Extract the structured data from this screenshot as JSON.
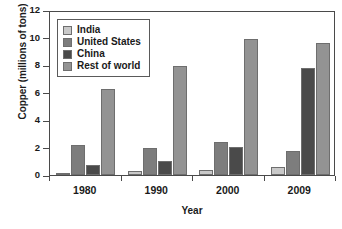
{
  "chart_data": {
    "type": "bar",
    "title": "",
    "xlabel": "Year",
    "ylabel": "Copper (millions of tons)",
    "categories": [
      "1980",
      "1990",
      "2000",
      "2009"
    ],
    "ylim": [
      0,
      12
    ],
    "yticks": [
      0,
      2,
      4,
      6,
      8,
      10,
      12
    ],
    "ytick_labels": [
      "0",
      "2",
      "4",
      "6",
      "8",
      "10",
      "12"
    ],
    "grid": false,
    "legend_position": "top-left",
    "series": [
      {
        "name": "India",
        "color": "#c9c9c9",
        "values": [
          0.17,
          0.27,
          0.37,
          0.55
        ]
      },
      {
        "name": "United States",
        "color": "#7d7d7d",
        "values": [
          2.15,
          1.95,
          2.37,
          1.75
        ]
      },
      {
        "name": "China",
        "color": "#4a4a4a",
        "values": [
          0.75,
          1.02,
          2.03,
          7.8
        ]
      },
      {
        "name": "Rest of world",
        "color": "#939393",
        "values": [
          6.25,
          7.9,
          9.88,
          9.62
        ]
      }
    ]
  },
  "axes": {
    "y_title": "Copper (millions of tons)",
    "x_title": "Year"
  },
  "colors": {
    "frame": "#4a4a4a",
    "bar_outline": "#6e6e6e",
    "background": "#ffffff",
    "text": "#1a1a1a"
  }
}
